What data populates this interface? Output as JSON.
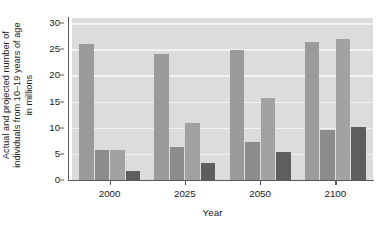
{
  "chart_data": {
    "type": "bar",
    "title": "",
    "xlabel": "Year",
    "ylabel_lines": [
      "Actual and projected number of",
      "individuals from 10–19 years of age",
      "in millions"
    ],
    "ylabel": "Actual and projected number of individuals from 10–19 years of age in millions",
    "categories": [
      "2000",
      "2025",
      "2050",
      "2100"
    ],
    "yticks": [
      0,
      5,
      10,
      15,
      20,
      25,
      30
    ],
    "ylim": [
      0,
      31
    ],
    "grid": true,
    "legend": "none",
    "series": [
      {
        "name": "bar-1",
        "color": "#9a9a9a",
        "values": [
          26.0,
          24.1,
          24.8,
          26.5
        ]
      },
      {
        "name": "bar-2",
        "color": "#8c8c8c",
        "values": [
          5.7,
          6.3,
          7.3,
          9.6
        ]
      },
      {
        "name": "bar-3",
        "color": "#a2a2a2",
        "values": [
          5.7,
          11.0,
          15.7,
          27.0
        ]
      },
      {
        "name": "bar-4",
        "color": "#5e5e5e",
        "values": [
          1.7,
          3.2,
          5.4,
          10.2
        ]
      }
    ]
  },
  "colors": {
    "plot_background": "#dcdcdc",
    "gridline": "#f2f2f2",
    "axis": "#5a5a5a",
    "text": "#1a1a1a"
  }
}
